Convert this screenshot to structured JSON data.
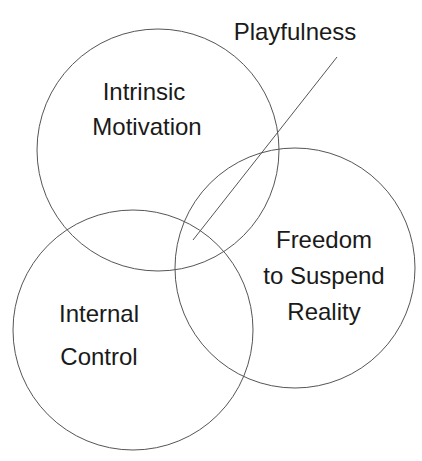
{
  "diagram": {
    "type": "venn",
    "circles": [
      {
        "id": "intrinsic",
        "label_lines": [
          "Intrinsic",
          "Motivation"
        ]
      },
      {
        "id": "internal",
        "label_lines": [
          "Internal",
          "Control"
        ]
      },
      {
        "id": "freedom",
        "label_lines": [
          "Freedom",
          "to Suspend",
          "Reality"
        ]
      }
    ],
    "callout": {
      "label": "Playfulness"
    },
    "stroke_color": "#555555"
  }
}
